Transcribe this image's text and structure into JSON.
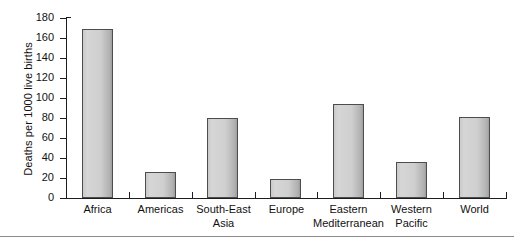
{
  "chart_data": {
    "type": "bar",
    "title": "",
    "xlabel": "",
    "ylabel": "Deaths per 1000 live births",
    "ylim": [
      0,
      180
    ],
    "yticks": [
      0,
      20,
      40,
      60,
      80,
      100,
      120,
      140,
      160,
      180
    ],
    "grid": false,
    "legend": null,
    "categories": [
      "Africa",
      "Americas",
      "South-East Asia",
      "Europe",
      "Eastern Mediterranean",
      "Western Pacific",
      "World"
    ],
    "category_lines": [
      [
        "Africa"
      ],
      [
        "Americas"
      ],
      [
        "South-East",
        "Asia"
      ],
      [
        "Europe"
      ],
      [
        "Eastern",
        "Mediterranean"
      ],
      [
        "Western",
        "Pacific"
      ],
      [
        "World"
      ]
    ],
    "values": [
      169,
      26,
      80,
      19,
      94,
      36,
      81
    ],
    "bar_fill_light": "#d6d6d6",
    "bar_fill_dark": "#9d9d9d",
    "bar_edge_color": "#4d4d4d",
    "axis_color": "#1d1d1d",
    "background_color": "#ffffff"
  }
}
